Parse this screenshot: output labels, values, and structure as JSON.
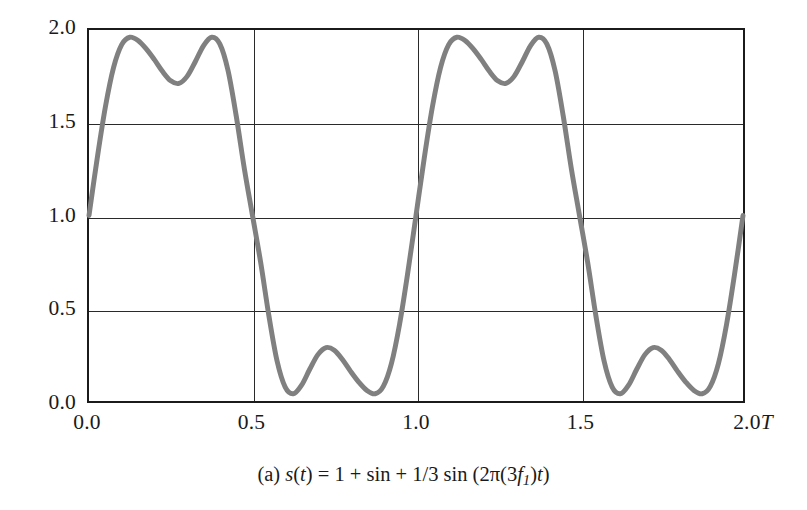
{
  "figure": {
    "caption_label": "(a)",
    "caption_text": "(a) s(t) = 1 + sin + 1/3 sin (2π(3f₁)t)",
    "caption_parts": {
      "label": "(a)",
      "s": "s",
      "open_t": "(",
      "t1": "t",
      "close_t": ")",
      "equals": " = 1 + sin + 1/3 sin (2",
      "pi": "π",
      "open2": "(3",
      "f": "f",
      "sub1": "1",
      "close2": ")",
      "t2": "t",
      "close3": ")"
    }
  },
  "chart_data": {
    "type": "line",
    "title": "",
    "subtitle": "",
    "xlabel": "",
    "ylabel": "",
    "xlim": [
      0.0,
      2.0
    ],
    "ylim": [
      0.0,
      2.0
    ],
    "grid": true,
    "legend": "none",
    "x_unit": "T",
    "x_ticks": [
      {
        "value": 0.0,
        "label": "0.0",
        "unit": ""
      },
      {
        "value": 0.5,
        "label": "0.5",
        "unit": ""
      },
      {
        "value": 1.0,
        "label": "1.0",
        "unit": ""
      },
      {
        "value": 1.5,
        "label": "1.5",
        "unit": ""
      },
      {
        "value": 2.0,
        "label": "2.0",
        "unit": "T"
      }
    ],
    "y_ticks": [
      {
        "value": 0.0,
        "label": "0.0"
      },
      {
        "value": 0.5,
        "label": "0.5"
      },
      {
        "value": 1.0,
        "label": "1.0"
      },
      {
        "value": 1.5,
        "label": "1.5"
      },
      {
        "value": 2.0,
        "label": "2.0"
      }
    ],
    "series": [
      {
        "name": "s(t) = 1 + sin(2πf₁t) + 1/3 sin(2π(3f₁)t)",
        "color": "#808080",
        "line_width": 5.0,
        "formula": "1 + sin(2*pi*x) + (1/3)*sin(6*pi*x)",
        "periods_shown": 2,
        "features": {
          "value_at_0": 1.0,
          "value_at_0_5": 1.0,
          "value_at_1_0": 1.0,
          "value_at_1_5": 1.0,
          "value_at_2_0": 1.0,
          "peak_value": 1.96,
          "peak_positions": [
            0.135,
            0.365,
            1.135,
            1.365
          ],
          "local_min_between_peaks": 1.72,
          "local_min_between_peaks_positions": [
            0.25,
            1.25
          ],
          "trough_value": 0.04,
          "trough_positions": [
            0.635,
            0.865,
            1.635,
            1.865
          ],
          "local_max_between_troughs": 0.28,
          "local_max_between_troughs_positions": [
            0.75,
            1.75
          ]
        },
        "points": [
          {
            "x": 0.0,
            "y": 1.0
          },
          {
            "x": 0.025,
            "y": 1.307
          },
          {
            "x": 0.05,
            "y": 1.584
          },
          {
            "x": 0.075,
            "y": 1.797
          },
          {
            "x": 0.1,
            "y": 1.921
          },
          {
            "x": 0.125,
            "y": 1.961
          },
          {
            "x": 0.15,
            "y": 1.943
          },
          {
            "x": 0.175,
            "y": 1.898
          },
          {
            "x": 0.2,
            "y": 1.84
          },
          {
            "x": 0.225,
            "y": 1.776
          },
          {
            "x": 0.25,
            "y": 1.726
          },
          {
            "x": 0.275,
            "y": 1.712
          },
          {
            "x": 0.3,
            "y": 1.75
          },
          {
            "x": 0.325,
            "y": 1.829
          },
          {
            "x": 0.35,
            "y": 1.915
          },
          {
            "x": 0.375,
            "y": 1.961
          },
          {
            "x": 0.4,
            "y": 1.925
          },
          {
            "x": 0.425,
            "y": 1.783
          },
          {
            "x": 0.45,
            "y": 1.539
          },
          {
            "x": 0.475,
            "y": 1.253
          },
          {
            "x": 0.5,
            "y": 1.0
          },
          {
            "x": 0.525,
            "y": 0.747
          },
          {
            "x": 0.55,
            "y": 0.461
          },
          {
            "x": 0.575,
            "y": 0.217
          },
          {
            "x": 0.6,
            "y": 0.075
          },
          {
            "x": 0.625,
            "y": 0.039
          },
          {
            "x": 0.65,
            "y": 0.085
          },
          {
            "x": 0.675,
            "y": 0.171
          },
          {
            "x": 0.7,
            "y": 0.25
          },
          {
            "x": 0.725,
            "y": 0.288
          },
          {
            "x": 0.75,
            "y": 0.274
          },
          {
            "x": 0.775,
            "y": 0.224
          },
          {
            "x": 0.8,
            "y": 0.16
          },
          {
            "x": 0.825,
            "y": 0.102
          },
          {
            "x": 0.85,
            "y": 0.057
          },
          {
            "x": 0.875,
            "y": 0.039
          },
          {
            "x": 0.9,
            "y": 0.079
          },
          {
            "x": 0.925,
            "y": 0.203
          },
          {
            "x": 0.95,
            "y": 0.416
          },
          {
            "x": 0.975,
            "y": 0.693
          },
          {
            "x": 1.0,
            "y": 1.0
          },
          {
            "x": 1.025,
            "y": 1.307
          },
          {
            "x": 1.05,
            "y": 1.584
          },
          {
            "x": 1.075,
            "y": 1.797
          },
          {
            "x": 1.1,
            "y": 1.921
          },
          {
            "x": 1.125,
            "y": 1.961
          },
          {
            "x": 1.15,
            "y": 1.943
          },
          {
            "x": 1.175,
            "y": 1.898
          },
          {
            "x": 1.2,
            "y": 1.84
          },
          {
            "x": 1.225,
            "y": 1.776
          },
          {
            "x": 1.25,
            "y": 1.726
          },
          {
            "x": 1.275,
            "y": 1.712
          },
          {
            "x": 1.3,
            "y": 1.75
          },
          {
            "x": 1.325,
            "y": 1.829
          },
          {
            "x": 1.35,
            "y": 1.915
          },
          {
            "x": 1.375,
            "y": 1.961
          },
          {
            "x": 1.4,
            "y": 1.925
          },
          {
            "x": 1.425,
            "y": 1.783
          },
          {
            "x": 1.45,
            "y": 1.539
          },
          {
            "x": 1.475,
            "y": 1.253
          },
          {
            "x": 1.5,
            "y": 1.0
          },
          {
            "x": 1.525,
            "y": 0.747
          },
          {
            "x": 1.55,
            "y": 0.461
          },
          {
            "x": 1.575,
            "y": 0.217
          },
          {
            "x": 1.6,
            "y": 0.075
          },
          {
            "x": 1.625,
            "y": 0.039
          },
          {
            "x": 1.65,
            "y": 0.085
          },
          {
            "x": 1.675,
            "y": 0.171
          },
          {
            "x": 1.7,
            "y": 0.25
          },
          {
            "x": 1.725,
            "y": 0.288
          },
          {
            "x": 1.75,
            "y": 0.274
          },
          {
            "x": 1.775,
            "y": 0.224
          },
          {
            "x": 1.8,
            "y": 0.16
          },
          {
            "x": 1.825,
            "y": 0.102
          },
          {
            "x": 1.85,
            "y": 0.057
          },
          {
            "x": 1.875,
            "y": 0.039
          },
          {
            "x": 1.9,
            "y": 0.079
          },
          {
            "x": 1.925,
            "y": 0.203
          },
          {
            "x": 1.95,
            "y": 0.416
          },
          {
            "x": 1.975,
            "y": 0.693
          },
          {
            "x": 2.0,
            "y": 1.0
          }
        ]
      }
    ],
    "colors": {
      "curve": "#808080",
      "axis": "#1b1b1b",
      "grid": "#2a2a2a",
      "background": "#ffffff",
      "text": "#1a1a1a"
    }
  }
}
